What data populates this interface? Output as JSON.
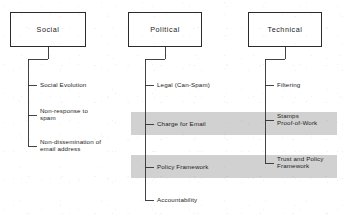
{
  "diagram": {
    "type": "tree-hierarchy",
    "orientation": "top-down",
    "background_color": "#ffffff",
    "line_color": "#2f2f2f",
    "highlight_band_color": "#cfcfcf",
    "columns": [
      {
        "id": "social",
        "root": {
          "label": "Social",
          "x": 10,
          "y": 12,
          "width": 76,
          "height": 35
        },
        "trunk_x": 28,
        "leaves": [
          {
            "label": "Social Evolution",
            "y": 85,
            "lines": 1
          },
          {
            "label": "Non-response to\nspam",
            "y": 115,
            "lines": 2
          },
          {
            "label": "Non-dissemination of\nemail address",
            "y": 146,
            "lines": 2
          }
        ]
      },
      {
        "id": "political",
        "root": {
          "label": "Political",
          "x": 128,
          "y": 12,
          "width": 74,
          "height": 35
        },
        "trunk_x": 145,
        "leaves": [
          {
            "label": "Legal (Can-Spam)",
            "y": 85,
            "lines": 1
          },
          {
            "label": "Charge for Email",
            "y": 124,
            "lines": 1
          },
          {
            "label": "Policy Framework",
            "y": 167,
            "lines": 1
          },
          {
            "label": "Accountability",
            "y": 200,
            "lines": 1
          }
        ]
      },
      {
        "id": "technical",
        "root": {
          "label": "Technical",
          "x": 248,
          "y": 12,
          "width": 74,
          "height": 35
        },
        "trunk_x": 265,
        "leaves": [
          {
            "label": "Filtering",
            "y": 85,
            "lines": 1
          },
          {
            "label": "Stamps\nProof-of-Work",
            "y": 120,
            "lines": 2
          },
          {
            "label": "Trust and Policy\nFramework",
            "y": 163,
            "lines": 2
          }
        ]
      }
    ],
    "highlight_bands": [
      {
        "id": "band-stamps-charge",
        "x": 131,
        "y": 112,
        "width": 206,
        "height": 23
      },
      {
        "id": "band-policy-trust",
        "x": 131,
        "y": 155,
        "width": 206,
        "height": 23
      }
    ]
  }
}
